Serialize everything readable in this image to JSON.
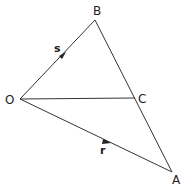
{
  "diagram": {
    "points": {
      "O": {
        "label": "O",
        "x": 20,
        "y": 99
      },
      "B": {
        "label": "B",
        "x": 95,
        "y": 20
      },
      "C": {
        "label": "C",
        "x": 135,
        "y": 98
      },
      "A": {
        "label": "A",
        "x": 172,
        "y": 172
      }
    },
    "segments": [
      {
        "from": "O",
        "to": "B",
        "vector_label": "s",
        "arrow": true
      },
      {
        "from": "O",
        "to": "A",
        "vector_label": "r",
        "arrow": true
      },
      {
        "from": "B",
        "to": "A",
        "arrow": false
      },
      {
        "from": "O",
        "to": "C",
        "arrow": false
      }
    ],
    "vectors": {
      "s": "s",
      "r": "r"
    },
    "line_color": "#333333"
  }
}
